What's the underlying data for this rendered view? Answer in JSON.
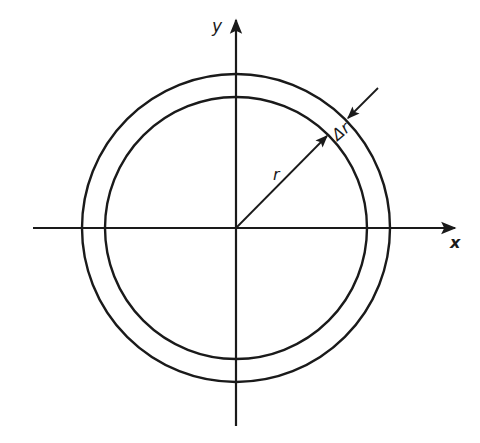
{
  "diagram": {
    "type": "annulus-polar-element",
    "center": {
      "x": 236,
      "y": 228
    },
    "outer_radius": 154,
    "inner_radius": 131,
    "axes": {
      "x": {
        "label": "x",
        "from": 33,
        "to": 458
      },
      "y": {
        "label": "y",
        "from": 426,
        "to": 18
      }
    },
    "radius_label": "r",
    "thickness_label": "Δr",
    "stroke_color": "#1a1a1a",
    "background": "#ffffff"
  }
}
